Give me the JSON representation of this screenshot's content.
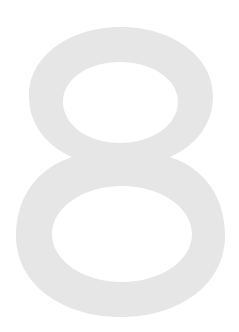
{
  "image": {
    "glyph": "8",
    "description": "large light gray numeral eight on white background",
    "fill_color": "#e6e6e6",
    "background_color": "#ffffff"
  }
}
